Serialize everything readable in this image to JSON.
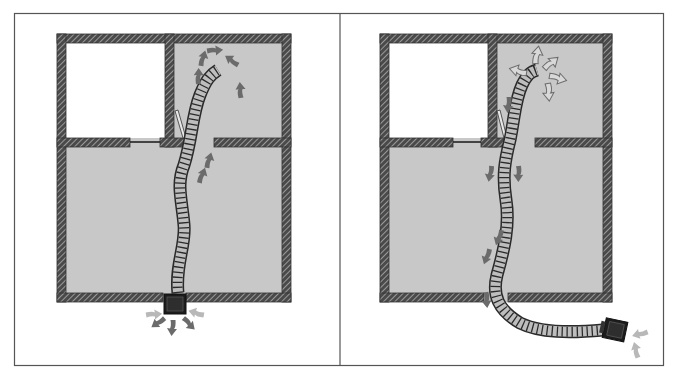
{
  "figure": {
    "colors": {
      "floor_fill": "#c8c8c8",
      "wall_hatch": "#4a4a4a",
      "hose": "#bdbdbd",
      "unit": "#1c1c1c",
      "arrow_dark": "#6b6b6b",
      "arrow_light": "#b8b8b8",
      "frame": "#555555"
    },
    "panels": [
      {
        "id": "left",
        "label": "",
        "unit_position": "in bottom exterior wall",
        "flow": "exhaust out through unit, air pushed into back room",
        "arrows_near_hose_end": 5,
        "arrows_in_hallway": 2,
        "arrows_at_unit": 5
      },
      {
        "id": "right",
        "label": "",
        "unit_position": "outside house, lower right",
        "flow": "air drawn from back room through hose toward outside unit",
        "arrows_near_hose_end": 4,
        "arrows_along_hose": 6,
        "arrows_at_unit": 2
      }
    ]
  }
}
